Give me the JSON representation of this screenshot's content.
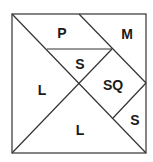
{
  "diagram": {
    "type": "tangram",
    "colors": {
      "line": "#333333",
      "text": "#1a1a1a",
      "background": "#ffffff"
    },
    "pieces": [
      {
        "id": "parallelogram",
        "label": "P"
      },
      {
        "id": "medium-triangle",
        "label": "M"
      },
      {
        "id": "small-triangle-top",
        "label": "S"
      },
      {
        "id": "square",
        "label": "SQ"
      },
      {
        "id": "large-triangle-left",
        "label": "L"
      },
      {
        "id": "large-triangle-bottom",
        "label": "L"
      },
      {
        "id": "small-triangle-right",
        "label": "S"
      }
    ]
  }
}
